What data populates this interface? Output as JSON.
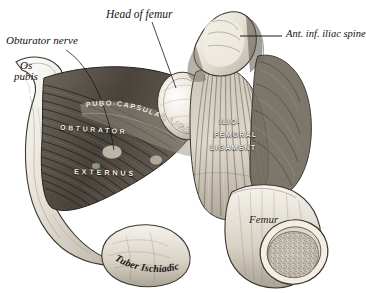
{
  "figure": {
    "style": "engraving",
    "background_color": "#ffffff",
    "ink_color": "#141210"
  },
  "labels": {
    "obturator_nerve": "Obturator nerve",
    "os_pubis_line1": "Os",
    "os_pubis_line2": "pubis",
    "head_of_femur": "Head of femur",
    "ant_inf_iliac_spine": "Ant. inf. iliac spine",
    "pubo_capsular_ligament": "PUBO-CAPSULAR LIGAMENT",
    "obturator": "OBTURATOR",
    "externus": "EXTERNUS",
    "ilio": "ILIO-",
    "femoral": "FEMORAL",
    "ligament": "LIGAMENT",
    "tuber_ischiadicum": "Tuber Ischiadicum",
    "femur": "Femur"
  },
  "structures": [
    {
      "name": "os-pubis",
      "kind": "bone"
    },
    {
      "name": "obturator-externus-muscle",
      "kind": "muscle"
    },
    {
      "name": "pubo-capsular-ligament",
      "kind": "ligament"
    },
    {
      "name": "head-of-femur",
      "kind": "bone"
    },
    {
      "name": "ilio-femoral-ligament",
      "kind": "ligament"
    },
    {
      "name": "anterior-inferior-iliac-spine",
      "kind": "bone"
    },
    {
      "name": "tuber-ischiadicum",
      "kind": "bone"
    },
    {
      "name": "femur-shaft",
      "kind": "bone"
    },
    {
      "name": "femur-cut-surface",
      "kind": "bone-cross-section"
    }
  ]
}
